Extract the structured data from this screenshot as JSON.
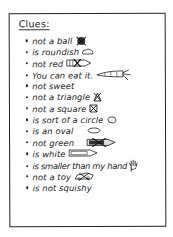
{
  "card": {
    "title": "Clues:",
    "clues": [
      {
        "text": "not a ball",
        "icon": "crossed-out-ball-icon"
      },
      {
        "text": "is roundish",
        "icon": "roundish-blob-icon"
      },
      {
        "text": "not red",
        "icon": "crossed-out-red-crayon-icon"
      },
      {
        "text": "You can eat it.",
        "icon": "carrot-icon"
      },
      {
        "text": "not sweet",
        "icon": null
      },
      {
        "text": "not a triangle",
        "icon": "crossed-out-triangle-icon"
      },
      {
        "text": "not a square",
        "icon": "crossed-out-square-icon"
      },
      {
        "text": "is sort of a circle",
        "icon": "circle-icon"
      },
      {
        "text": "is an oval",
        "icon": "oval-icon"
      },
      {
        "text": "not green",
        "icon": "crossed-out-green-crayon-icon"
      },
      {
        "text": "is white",
        "icon": "white-crayon-icon"
      },
      {
        "text": "is smaller than my hand",
        "icon": "hand-icon"
      },
      {
        "text": "not a toy",
        "icon": "crossed-out-toy-car-icon"
      },
      {
        "text": "is not squishy",
        "icon": null
      }
    ]
  },
  "colors": {
    "ink": "#1a1a1a",
    "paper": "#ffffff"
  }
}
